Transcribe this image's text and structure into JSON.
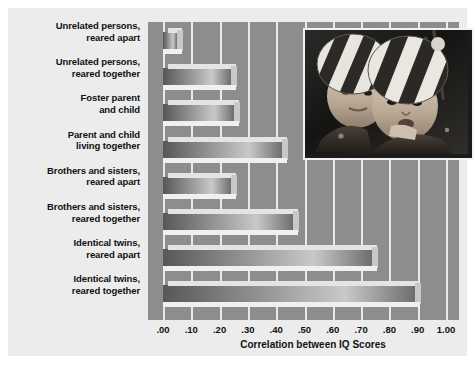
{
  "chart_data": {
    "type": "bar",
    "orientation": "horizontal",
    "title": "",
    "xlabel": "Correlation between IQ Scores",
    "ylabel": "",
    "xlim": [
      0,
      1.0
    ],
    "grid": true,
    "legend": "none",
    "categories": [
      "Unrelated persons, reared apart",
      "Unrelated persons, reared together",
      "Foster parent and child",
      "Parent and child living together",
      "Brothers and sisters, reared apart",
      "Brothers and sisters, reared together",
      "Identical twins, reared apart",
      "Identical twins, reared together"
    ],
    "category_lines": [
      [
        "Unrelated persons,",
        "reared apart"
      ],
      [
        "Unrelated persons,",
        "reared together"
      ],
      [
        "Foster parent",
        "and child"
      ],
      [
        "Parent and child",
        "living together"
      ],
      [
        "Brothers and sisters,",
        "reared apart"
      ],
      [
        "Brothers and sisters,",
        "reared together"
      ],
      [
        "Identical twins,",
        "reared apart"
      ],
      [
        "Identical twins,",
        "reared together"
      ]
    ],
    "values": [
      0.05,
      0.24,
      0.25,
      0.42,
      0.24,
      0.46,
      0.74,
      0.89
    ],
    "tick_values": [
      0.0,
      0.1,
      0.2,
      0.3,
      0.4,
      0.5,
      0.6,
      0.7,
      0.8,
      0.9,
      1.0
    ],
    "tick_labels": [
      ".00",
      ".10",
      ".20",
      ".30",
      ".40",
      ".50",
      ".60",
      ".70",
      ".80",
      ".90",
      "1.00"
    ]
  },
  "figure": {
    "panel_background": "#ececed",
    "plot_background": "#8d8d8d",
    "gridline_color": "#e9e9e9",
    "bar_color": "#9d9d9d",
    "text_color": "#111111"
  },
  "photo": {
    "caption": "photograph of two identical twin toddlers wearing striped knit hats",
    "alt": "twin-toddlers-photo"
  }
}
